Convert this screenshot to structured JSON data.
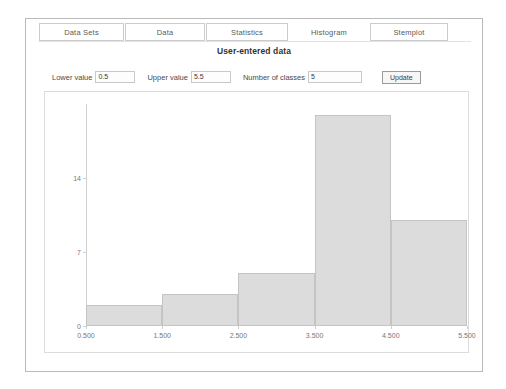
{
  "window": {
    "title": ""
  },
  "tabs": [
    {
      "label": "Data Sets",
      "active": false
    },
    {
      "label": "Data",
      "active": false
    },
    {
      "label": "Statistics",
      "active": false
    },
    {
      "label": "Histogram",
      "active": true
    },
    {
      "label": "Stemplot",
      "active": false
    }
  ],
  "page": {
    "title": "User-entered data"
  },
  "controls": {
    "lower_label": "Lower value",
    "lower_value": "0.5",
    "upper_label": "Upper value",
    "upper_value": "5.5",
    "classes_label": "Number of classes",
    "classes_value": "5",
    "update_label": "Update"
  },
  "chart_data": {
    "type": "bar",
    "title": "User-entered data",
    "xlabel": "",
    "ylabel": "",
    "categories": [
      "0.500-1.500",
      "1.500-2.500",
      "2.500-3.500",
      "3.500-4.500",
      "4.500-5.500"
    ],
    "bin_edges": [
      0.5,
      1.5,
      2.5,
      3.5,
      4.5,
      5.5
    ],
    "values": [
      2,
      3,
      5,
      20,
      10
    ],
    "xlim": [
      0.5,
      5.5
    ],
    "ylim": [
      0,
      21
    ],
    "xticks": [
      "0.500",
      "1.500",
      "2.500",
      "3.500",
      "4.500",
      "5.500"
    ],
    "xtick_values": [
      0.5,
      1.5,
      2.5,
      3.5,
      4.5,
      5.5
    ],
    "yticks": [
      "0",
      "7",
      "14"
    ],
    "ytick_values": [
      0,
      7,
      14
    ],
    "grid": false,
    "legend": false,
    "bar_fill": "#dcdcdc",
    "bar_stroke": "#c4c4c4"
  }
}
